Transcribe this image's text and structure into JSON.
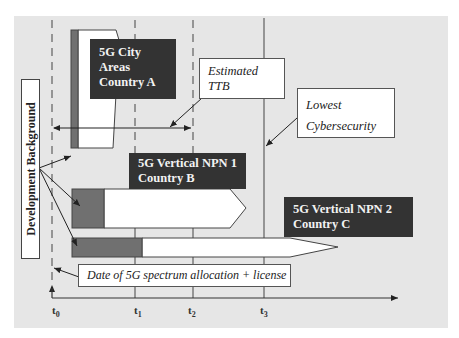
{
  "diagram": {
    "title": "",
    "colors": {
      "background": "#e6e6e6",
      "dark_label": "#333333",
      "gray_bar": "#707070",
      "white_bar": "#ffffff",
      "line": "#333333"
    },
    "boxes": {
      "city": {
        "lines": [
          "5G City",
          "Areas",
          "Country A"
        ]
      },
      "npn1": {
        "lines": [
          "5G Vertical NPN 1",
          "Country B"
        ]
      },
      "npn2": {
        "lines": [
          "5G Vertical NPN 2",
          "Country C"
        ]
      }
    },
    "callouts": {
      "ttb": {
        "lines": [
          "Estimated",
          "TTB"
        ]
      },
      "cyber": {
        "lines": [
          "Lowest",
          "Cybersecurity"
        ]
      },
      "date": {
        "text": "Date of 5G spectrum allocation + license"
      }
    },
    "side_label": "Development Background",
    "axis": {
      "ticks": [
        {
          "base": "t",
          "sub": "0"
        },
        {
          "base": "t",
          "sub": "1"
        },
        {
          "base": "t",
          "sub": "2"
        },
        {
          "base": "t",
          "sub": "3"
        }
      ]
    }
  }
}
